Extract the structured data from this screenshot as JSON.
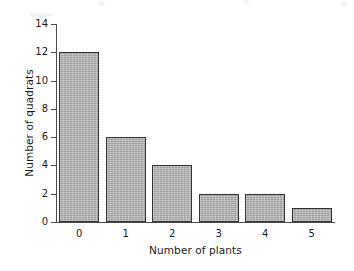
{
  "chart_data": {
    "type": "bar",
    "title": "",
    "xlabel": "Number of plants",
    "ylabel": "Number of quadrats",
    "categories": [
      "0",
      "1",
      "2",
      "3",
      "4",
      "5"
    ],
    "values": [
      12,
      6,
      4,
      2,
      2,
      1
    ],
    "ylim": [
      0,
      14
    ],
    "ytick_labels": [
      "0",
      "2",
      "4",
      "6",
      "8",
      "10",
      "12",
      "14"
    ],
    "ytick_values": [
      0,
      2,
      4,
      6,
      8,
      10,
      12,
      14
    ],
    "grid": false,
    "legend": null,
    "legend_position": "none",
    "series": [
      {
        "name": "Number of quadrats",
        "values": [
          12,
          6,
          4,
          2,
          2,
          1
        ]
      }
    ],
    "colors": {
      "bar_fill": "#b2b2b2",
      "bar_edge": "#333333",
      "axis": "#4a4a4a",
      "text": "#1a1a1a",
      "background": "#ffffff"
    }
  }
}
